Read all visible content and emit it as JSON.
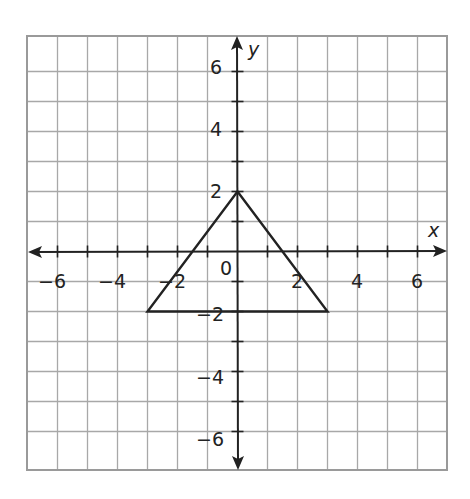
{
  "chart_data": {
    "type": "scatter",
    "title": "",
    "xlabel": "x",
    "ylabel": "y",
    "xlim": [
      -7,
      7
    ],
    "ylim": [
      -7,
      7
    ],
    "grid": true,
    "x_ticks": [
      -6,
      -4,
      -2,
      2,
      4,
      6
    ],
    "y_ticks": [
      6,
      4,
      2,
      -2,
      -4,
      -6
    ],
    "origin_label": "0",
    "series": [
      {
        "name": "triangle",
        "shape": "polygon",
        "points": [
          [
            0,
            2
          ],
          [
            3,
            -2
          ],
          [
            -3,
            -2
          ]
        ]
      }
    ]
  },
  "labels": {
    "x_axis": "x",
    "y_axis": "y",
    "origin": "0",
    "xt": [
      "−6",
      "−4",
      "−2",
      "2",
      "4",
      "6"
    ],
    "yt": [
      "6",
      "4",
      "2",
      "−2",
      "−4",
      "−6"
    ]
  }
}
